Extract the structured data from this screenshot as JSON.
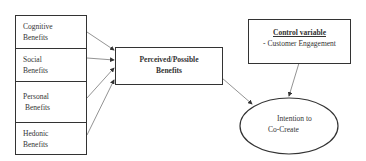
{
  "diagram": {
    "benefits": [
      {
        "line1": "Cognitive",
        "line2": "Benefits"
      },
      {
        "line1": "Social",
        "line2": "Benefits"
      },
      {
        "line1": "Personal",
        "line2": "Benefits"
      },
      {
        "line1": "Hedonic",
        "line2": "Benefits"
      }
    ],
    "central": {
      "line1": "Perceived/Possible",
      "line2": "Benefits"
    },
    "control": {
      "title": "Control variable",
      "item": "- Customer Engagement"
    },
    "outcome": {
      "line1": "Intention to",
      "line2": "Co-Create"
    },
    "colors": {
      "line": "#333333",
      "arrow": "#555555"
    }
  }
}
